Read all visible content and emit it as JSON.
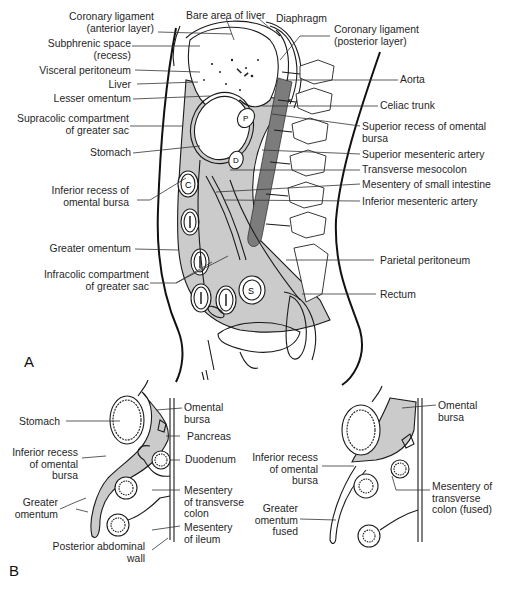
{
  "figure": {
    "panels": [
      {
        "id": "A",
        "letter": "A",
        "title": "Sagittal section of the abdomen showing peritoneum"
      },
      {
        "id": "B",
        "letter": "B",
        "title": "Development of greater omentum and fusion of transverse mesocolon"
      }
    ]
  },
  "panel_a": {
    "letter": "A",
    "labels_left": [
      {
        "l1": "Coronary ligament",
        "l2": "(anterior layer)"
      },
      {
        "l1": "Subphrenic space",
        "l2": "(recess)"
      },
      {
        "l1": "Visceral peritoneum"
      },
      {
        "l1": "Liver"
      },
      {
        "l1": "Lesser omentum"
      },
      {
        "l1": "Supracolic compartment",
        "l2": "of greater sac"
      },
      {
        "l1": "Stomach"
      },
      {
        "l1": "Inferior recess of",
        "l2": "omental bursa"
      },
      {
        "l1": "Greater omentum"
      },
      {
        "l1": "Infracolic compartment",
        "l2": "of greater sac"
      }
    ],
    "labels_top": [
      {
        "l1": "Bare area of liver"
      },
      {
        "l1": "Diaphragm"
      },
      {
        "l1": "Coronary ligament",
        "l2": "(posterior layer)"
      }
    ],
    "labels_right": [
      {
        "l1": "Aorta"
      },
      {
        "l1": "Celiac trunk"
      },
      {
        "l1": "Superior recess of omental",
        "l2": "bursa"
      },
      {
        "l1": "Superior mesenteric artery"
      },
      {
        "l1": "Transverse mesocolon"
      },
      {
        "l1": "Mesentery of small intestine"
      },
      {
        "l1": "Inferior mesenteric artery"
      },
      {
        "l1": "Parietal peritoneum"
      },
      {
        "l1": "Rectum"
      }
    ],
    "organ_glyphs": {
      "pancreas": "P",
      "duodenum": "D",
      "colon": "C",
      "ileum": "I",
      "sigmoid": "S"
    }
  },
  "panel_b": {
    "letter": "B",
    "left_labels": [
      {
        "l1": "Stomach"
      },
      {
        "l1": "Inferior recess",
        "l2": "of omental",
        "l3": "bursa"
      },
      {
        "l1": "Greater",
        "l2": "omentum"
      },
      {
        "l1": "Posterior abdominal",
        "l2": "wall"
      }
    ],
    "mid_labels": [
      {
        "l1": "Omental",
        "l2": "bursa"
      },
      {
        "l1": "Pancreas"
      },
      {
        "l1": "Duodenum"
      },
      {
        "l1": "Mesentery",
        "l2": "of transverse",
        "l3": "colon"
      },
      {
        "l1": "Mesentery",
        "l2": "of ileum"
      }
    ],
    "right_left_labels": [
      {
        "l1": "Inferior recess",
        "l2": "of omental",
        "l3": "bursa"
      },
      {
        "l1": "Greater",
        "l2": "omentum",
        "l3": "fused"
      }
    ],
    "right_labels": [
      {
        "l1": "Omental",
        "l2": "bursa"
      },
      {
        "l1": "Mesentery of",
        "l2": "transverse",
        "l3": "colon (fused)"
      }
    ]
  },
  "colors": {
    "line": "#1a1a1a",
    "shade_light": "#c9c9c9",
    "shade_dark": "#7a7a7a",
    "background": "#ffffff"
  }
}
